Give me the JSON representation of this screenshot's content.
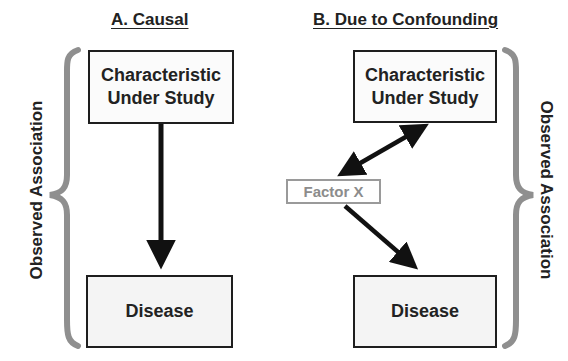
{
  "panels": {
    "causal": {
      "title": "A. Causal",
      "top_box": "Characteristic\nUnder Study",
      "top_box_line1": "Characteristic",
      "top_box_line2": "Under Study",
      "bottom_box": "Disease",
      "brace_label": "Observed Association"
    },
    "confounding": {
      "title": "B. Due to Confounding",
      "top_box_line1": "Characteristic",
      "top_box_line2": "Under Study",
      "bottom_box": "Disease",
      "confounder": "Factor X",
      "brace_label": "Observed Association"
    }
  },
  "colors": {
    "box_border": "#1e1e1e",
    "box_fill": "#f4f4f4",
    "brace": "#8f8f8f",
    "confounder": "#9a9a9a",
    "arrow": "#111111"
  }
}
